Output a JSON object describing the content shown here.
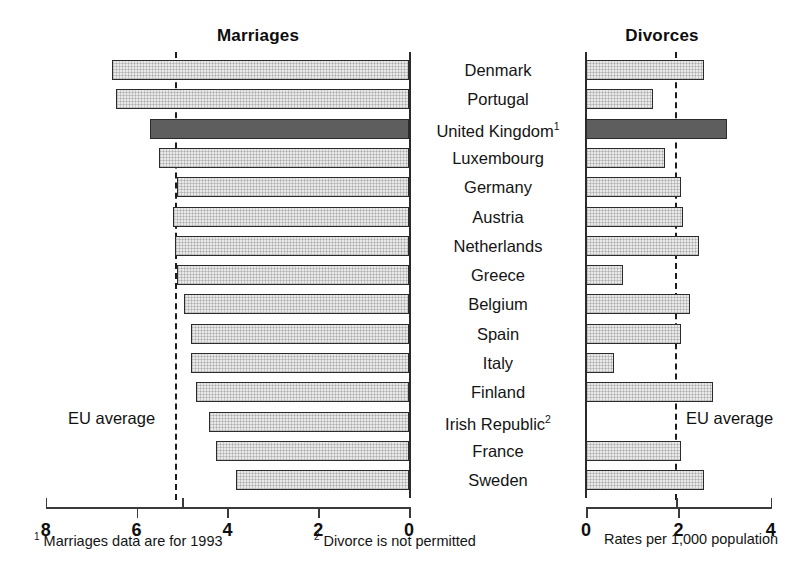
{
  "headers": {
    "left": "Marriages",
    "right": "Divorces"
  },
  "eu_average_label": "EU average",
  "footnotes": {
    "one_marker": "1",
    "one": " Marriages data are for 1993",
    "two_marker": "2",
    "two": " Divorce is not permitted",
    "units": "Rates per 1,000 population"
  },
  "axes": {
    "left_ticks": [
      "8",
      "6",
      "4",
      "2",
      "0"
    ],
    "right_ticks": [
      "0",
      "2",
      "4"
    ],
    "left_range": [
      0,
      8
    ],
    "right_range": [
      0,
      4
    ]
  },
  "chart_data": {
    "type": "bar",
    "orientation": "horizontal-bidirectional",
    "xlabel": "Rates per 1,000 population",
    "ylabel": "",
    "grid": false,
    "legend": "none",
    "left_axis": {
      "name": "Marriages",
      "min": 0,
      "max": 8,
      "ticks": [
        8,
        6,
        4,
        2,
        0
      ],
      "direction": "right-to-left"
    },
    "right_axis": {
      "name": "Divorces",
      "min": 0,
      "max": 4,
      "ticks": [
        0,
        2,
        4
      ],
      "direction": "left-to-right"
    },
    "annotations": [
      {
        "label": "EU average",
        "axis": "Marriages",
        "value": 5.0
      },
      {
        "label": "EU average",
        "axis": "Divorces",
        "value": 1.95
      }
    ],
    "categories": [
      "Denmark",
      "Portugal",
      "United Kingdom",
      "Luxembourg",
      "Germany",
      "Austria",
      "Netherlands",
      "Greece",
      "Belgium",
      "Spain",
      "Italy",
      "Finland",
      "Irish Republic",
      "France",
      "Sweden"
    ],
    "series": [
      {
        "name": "Marriages",
        "values": [
          6.55,
          6.45,
          5.7,
          5.5,
          5.1,
          5.2,
          5.15,
          5.1,
          4.95,
          4.8,
          4.8,
          4.7,
          4.4,
          4.25,
          3.8
        ]
      },
      {
        "name": "Divorces",
        "values": [
          2.55,
          1.45,
          3.05,
          1.7,
          2.05,
          2.1,
          2.45,
          0.8,
          2.25,
          2.05,
          0.6,
          2.75,
          0.0,
          2.05,
          2.55
        ]
      }
    ],
    "rows": [
      {
        "category": "Denmark",
        "marriages": 6.55,
        "divorces": 2.55,
        "highlight": false,
        "footnote": ""
      },
      {
        "category": "Portugal",
        "marriages": 6.45,
        "divorces": 1.45,
        "highlight": false,
        "footnote": ""
      },
      {
        "category": "United Kingdom",
        "marriages": 5.7,
        "divorces": 3.05,
        "highlight": true,
        "footnote": "1"
      },
      {
        "category": "Luxembourg",
        "marriages": 5.5,
        "divorces": 1.7,
        "highlight": false,
        "footnote": ""
      },
      {
        "category": "Germany",
        "marriages": 5.1,
        "divorces": 2.05,
        "highlight": false,
        "footnote": ""
      },
      {
        "category": "Austria",
        "marriages": 5.2,
        "divorces": 2.1,
        "highlight": false,
        "footnote": ""
      },
      {
        "category": "Netherlands",
        "marriages": 5.15,
        "divorces": 2.45,
        "highlight": false,
        "footnote": ""
      },
      {
        "category": "Greece",
        "marriages": 5.1,
        "divorces": 0.8,
        "highlight": false,
        "footnote": ""
      },
      {
        "category": "Belgium",
        "marriages": 4.95,
        "divorces": 2.25,
        "highlight": false,
        "footnote": ""
      },
      {
        "category": "Spain",
        "marriages": 4.8,
        "divorces": 2.05,
        "highlight": false,
        "footnote": ""
      },
      {
        "category": "Italy",
        "marriages": 4.8,
        "divorces": 0.6,
        "highlight": false,
        "footnote": ""
      },
      {
        "category": "Finland",
        "marriages": 4.7,
        "divorces": 2.75,
        "highlight": false,
        "footnote": ""
      },
      {
        "category": "Irish Republic",
        "marriages": 4.4,
        "divorces": 0.0,
        "highlight": false,
        "footnote": "2"
      },
      {
        "category": "France",
        "marriages": 4.25,
        "divorces": 2.05,
        "highlight": false,
        "footnote": ""
      },
      {
        "category": "Sweden",
        "marriages": 3.8,
        "divorces": 2.55,
        "highlight": false,
        "footnote": ""
      }
    ]
  },
  "colors": {
    "bar_fill": "#e9e9e9",
    "bar_highlight": "#5e5e5e",
    "bar_stroke": "#2b2b2b",
    "axis": "#3a3a3a",
    "text": "#141414"
  }
}
